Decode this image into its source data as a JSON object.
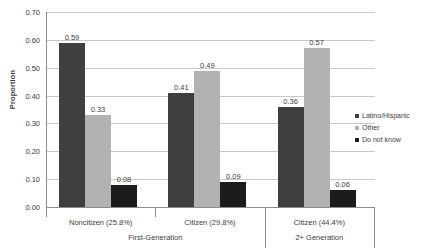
{
  "chart_data": {
    "type": "bar",
    "title": "",
    "xlabel": "",
    "ylabel": "Proportion",
    "ylim": [
      0.0,
      0.7
    ],
    "ytick_labels": [
      "0.00",
      "0.10",
      "0.20",
      "0.30",
      "0.40",
      "0.50",
      "0.60",
      "0.70"
    ],
    "ytick_values": [
      0.0,
      0.1,
      0.2,
      0.3,
      0.4,
      0.5,
      0.6,
      0.7
    ],
    "grid": true,
    "legend_position": "right",
    "categories": [
      "Noncitizen (25.8%)",
      "Citizen (29.8%)",
      "Citizen (44.4%)"
    ],
    "group_labels": [
      "First-Generation",
      "2+ Generation"
    ],
    "series": [
      {
        "name": "Latino/Hispanic",
        "color": "#3f3f3f",
        "values": [
          0.59,
          0.41,
          0.36
        ],
        "labels": [
          "0.59",
          "0.41",
          "0.36"
        ]
      },
      {
        "name": "Other",
        "color": "#b2b2b2",
        "values": [
          0.33,
          0.49,
          0.57
        ],
        "labels": [
          "0.33",
          "0.49",
          "0.57"
        ]
      },
      {
        "name": "Do not know",
        "color": "#1c1c1c",
        "values": [
          0.08,
          0.09,
          0.06
        ],
        "labels": [
          "0.08",
          "0.09",
          "0.06"
        ]
      }
    ]
  },
  "legend": {
    "items": [
      {
        "label": "Latino/Hispanic",
        "color": "#3f3f3f"
      },
      {
        "label": "Other",
        "color": "#b2b2b2"
      },
      {
        "label": "Do not know",
        "color": "#1c1c1c"
      }
    ]
  },
  "axis": {
    "y_title": "Proportion"
  }
}
